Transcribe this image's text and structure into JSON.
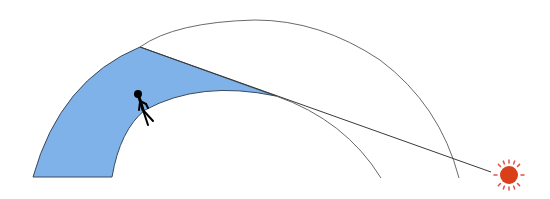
{
  "diagram": {
    "colors": {
      "background": "#ffffff",
      "region_fill": "#7fb2e8",
      "region_stroke": "#3a4a5c",
      "arc_stroke": "#6a6a6a",
      "ray_stroke": "#3a3a3a",
      "person": "#000000",
      "sun_body": "#d9401a",
      "sun_rays": "#e0504a"
    },
    "elements": [
      {
        "name": "inner-arc",
        "description": "Inner curved surface (ground)"
      },
      {
        "name": "outer-arc",
        "description": "Outer curved boundary"
      },
      {
        "name": "shaded-region",
        "description": "Blue region between arcs bounded by tangent ray"
      },
      {
        "name": "tangent-ray",
        "description": "Straight line from top of region tangent to inner arc toward sun"
      },
      {
        "name": "person",
        "description": "Stick figure standing on inner arc"
      },
      {
        "name": "sun",
        "description": "Red-orange sun with rays at lower right"
      }
    ]
  }
}
